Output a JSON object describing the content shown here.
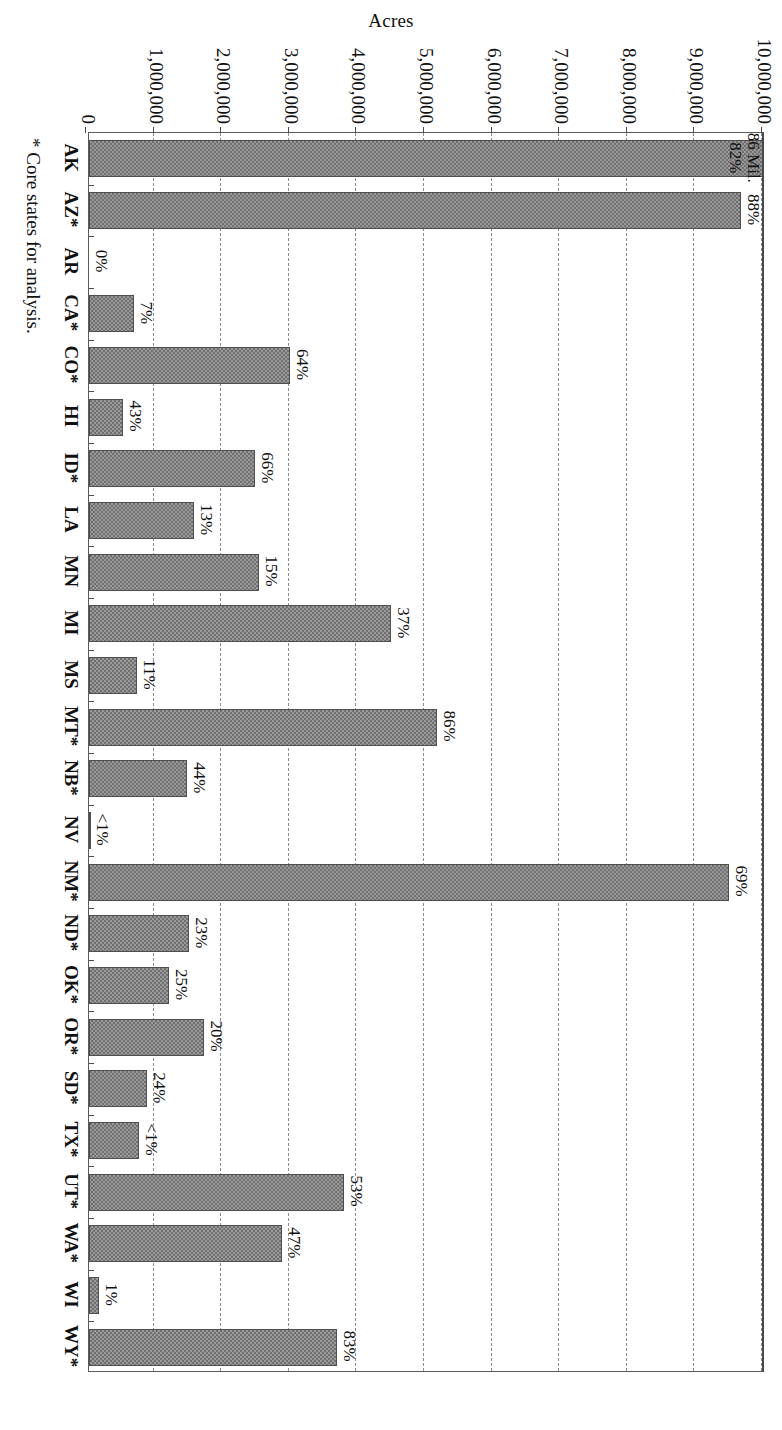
{
  "chart_data": {
    "type": "bar",
    "title": "",
    "xlabel": "",
    "ylabel": "Acres",
    "ylim": [
      0,
      10000000
    ],
    "grid": true,
    "legend": "none",
    "orientation": "vertical-rotated-90",
    "ytick_labels": [
      "10,000,000",
      "9,000,000",
      "8,000,000",
      "7,000,000",
      "6,000,000",
      "5,000,000",
      "4,000,000",
      "3,000,000",
      "2,000,000",
      "1,000,000",
      "0"
    ],
    "ytick_values": [
      10000000,
      9000000,
      8000000,
      7000000,
      6000000,
      5000000,
      4000000,
      3000000,
      2000000,
      1000000,
      0
    ],
    "categories": [
      "AK",
      "AZ*",
      "AR",
      "CA*",
      "CO*",
      "HI",
      "ID*",
      "LA",
      "MN",
      "MI",
      "MS",
      "MT*",
      "NB*",
      "NV",
      "NM*",
      "ND*",
      "OK*",
      "OR*",
      "SD*",
      "TX*",
      "UT*",
      "WA*",
      "WI",
      "WY*"
    ],
    "values": [
      10000000,
      9650000,
      0,
      670000,
      2970000,
      500000,
      2450000,
      1550000,
      2510000,
      4470000,
      710000,
      5150000,
      1450000,
      20000,
      9470000,
      1480000,
      1180000,
      1700000,
      860000,
      740000,
      3770000,
      2860000,
      150000,
      3670000
    ],
    "data_labels": [
      "82%",
      "88%",
      "0%",
      "7%",
      "64%",
      "43%",
      "66%",
      "13%",
      "15%",
      "37%",
      "11%",
      "86%",
      "44%",
      "<1%",
      "69%",
      "23%",
      "25%",
      "20%",
      "24%",
      "<1%",
      "53%",
      "47%",
      "1%",
      "83%"
    ],
    "annotations": [
      {
        "category": "AK",
        "text": "86 Mil.",
        "note": "AK bar exceeds axis maximum; actual value 86 million acres"
      }
    ],
    "footnote": "* Core states for analysis."
  },
  "colors": {
    "bar_fill": "#9a9a9a",
    "bar_hatch": "#6f6f6f",
    "bar_border": "#4f4f4f",
    "axis": "#4a4a4a",
    "gridline": "#8d8d8d",
    "text": "#111111",
    "background": "#ffffff"
  }
}
